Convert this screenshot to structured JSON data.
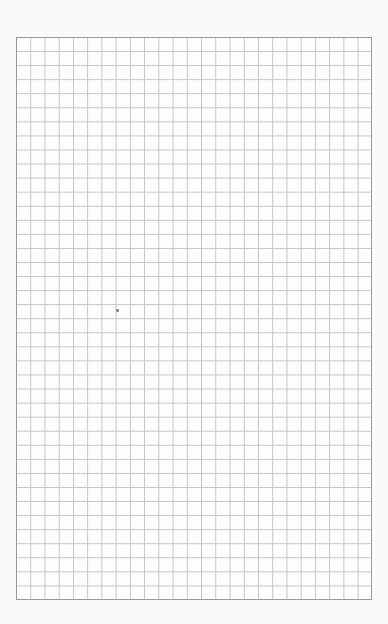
{
  "grid": {
    "columns": 25,
    "rows": 40,
    "line_color": "#c4c4c4",
    "border_color": "#9a9a9a",
    "background": "#fdfdfd"
  }
}
